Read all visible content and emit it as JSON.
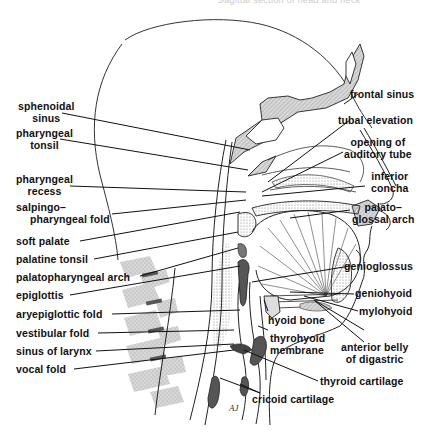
{
  "figure": {
    "title_fragment": "Sagittal section of head and neck",
    "artist_signature": "AJ"
  },
  "labels_left": [
    {
      "id": "sphenoidal-sinus",
      "text": [
        "sphenoidal",
        "sinus"
      ]
    },
    {
      "id": "pharyngeal-tonsil",
      "text": [
        "pharyngeal",
        "tonsil"
      ]
    },
    {
      "id": "pharyngeal-recess",
      "text": [
        "pharyngeal",
        "recess"
      ]
    },
    {
      "id": "salpingopharyngeal-fold",
      "text": [
        "salpingo–",
        "pharyngeal fold"
      ]
    },
    {
      "id": "soft-palate",
      "text": [
        "soft palate"
      ]
    },
    {
      "id": "palatine-tonsil",
      "text": [
        "palatine tonsil"
      ]
    },
    {
      "id": "palatopharyngeal-arch",
      "text": [
        "palatopharyngeal arch"
      ]
    },
    {
      "id": "epiglottis",
      "text": [
        "epiglottis"
      ]
    },
    {
      "id": "aryepiglottic-fold",
      "text": [
        "aryepiglottic fold"
      ]
    },
    {
      "id": "vestibular-fold",
      "text": [
        "vestibular fold"
      ]
    },
    {
      "id": "sinus-of-larynx",
      "text": [
        "sinus of larynx"
      ]
    },
    {
      "id": "vocal-fold",
      "text": [
        "vocal fold"
      ]
    }
  ],
  "labels_right": [
    {
      "id": "frontal-sinus",
      "text": [
        "frontal sinus"
      ]
    },
    {
      "id": "tubal-elevation",
      "text": [
        "tubal elevation"
      ]
    },
    {
      "id": "opening-of-auditory-tube",
      "text": [
        "opening of",
        "auditory tube"
      ]
    },
    {
      "id": "inferior-concha",
      "text": [
        "inferior",
        "concha"
      ]
    },
    {
      "id": "palatoglossal-arch",
      "text": [
        "palato–",
        "glossal arch"
      ]
    },
    {
      "id": "genioglossus",
      "text": [
        "genioglossus"
      ]
    },
    {
      "id": "geniohyoid",
      "text": [
        "geniohyoid"
      ]
    },
    {
      "id": "mylohyoid",
      "text": [
        "mylohyoid"
      ]
    },
    {
      "id": "anterior-belly-of-digastric",
      "text": [
        "anterior belly",
        "of digastric"
      ]
    }
  ],
  "labels_bottom": [
    {
      "id": "hyoid-bone",
      "text": [
        "hyoid bone"
      ]
    },
    {
      "id": "thyrohyoid-membrane",
      "text": [
        "thyrohyoid",
        "membrane"
      ]
    },
    {
      "id": "thyroid-cartilage",
      "text": [
        "thyroid cartilage"
      ]
    },
    {
      "id": "cricoid-cartilage",
      "text": [
        "cricoid cartilage"
      ]
    }
  ],
  "colors": {
    "line": "#1a1a1a",
    "bone_fill": "#cfcfcf",
    "stipple": "#b8b8b8",
    "vertebra": "#c9c9c9",
    "cartilage": "#555555"
  }
}
